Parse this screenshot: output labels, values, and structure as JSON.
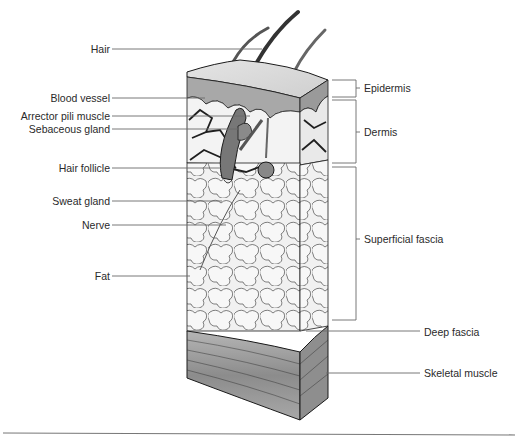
{
  "figure": {
    "left_labels": [
      {
        "id": "hair",
        "text": "Hair",
        "y": 49
      },
      {
        "id": "blood-vessel",
        "text": "Blood vessel",
        "y": 98
      },
      {
        "id": "arrector-pili-muscle",
        "text": "Arrector pili muscle",
        "y": 116
      },
      {
        "id": "sebaceous-gland",
        "text": "Sebaceous gland",
        "y": 129
      },
      {
        "id": "hair-follicle",
        "text": "Hair follicle",
        "y": 168
      },
      {
        "id": "sweat-gland",
        "text": "Sweat gland",
        "y": 201
      },
      {
        "id": "nerve",
        "text": "Nerve",
        "y": 225
      },
      {
        "id": "fat",
        "text": "Fat",
        "y": 276
      }
    ],
    "right_labels": [
      {
        "id": "epidermis",
        "text": "Epidermis",
        "y": 88
      },
      {
        "id": "dermis",
        "text": "Dermis",
        "y": 132
      },
      {
        "id": "superficial-fascia",
        "text": "Superficial fascia",
        "y": 239
      },
      {
        "id": "deep-fascia",
        "text": "Deep fascia",
        "y": 332
      },
      {
        "id": "skeletal-muscle",
        "text": "Skeletal muscle",
        "y": 373
      }
    ]
  },
  "colors": {
    "outline": "#1a1a1a",
    "leader": "#6a6a6a",
    "label_text": "#2a2a2a",
    "epidermis": "#b8b8b8",
    "fat_fill": "#ececec",
    "muscle": "#9a9a9a",
    "hair": "#444444"
  }
}
